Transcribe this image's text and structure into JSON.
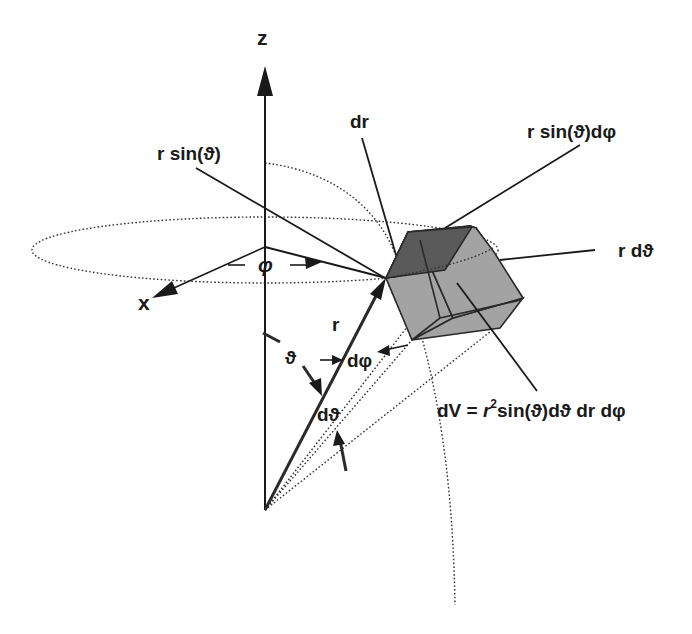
{
  "diagram": {
    "labels": {
      "z_axis": "z",
      "x_axis": "x",
      "r_sin_theta": "r sin(ϑ)",
      "dr": "dr",
      "r_sin_theta_dphi": "r sin(ϑ)dφ",
      "r_dtheta": "r dϑ",
      "phi": "φ",
      "r": "r",
      "theta": "ϑ",
      "dphi": "dφ",
      "dtheta": "dϑ",
      "volume_formula_prefix": "dV = ",
      "volume_formula_r": "r",
      "volume_formula_exp": "2",
      "volume_formula_rest": "sin(ϑ)dϑ dr dφ"
    },
    "colors": {
      "ink": "#1a1a1a",
      "cube_top": "#5a5a5a",
      "cube_side": "#a3a3a3",
      "background": "#ffffff"
    }
  }
}
